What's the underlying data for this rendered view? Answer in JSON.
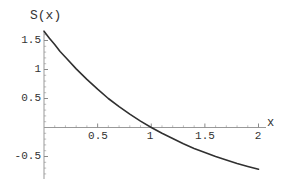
{
  "figure": {
    "background": "#ffffff",
    "y_axis_label": "S(x)",
    "x_axis_label": "x"
  },
  "colors": {
    "curve": "#303030",
    "axis": "#999999",
    "tick": "#8a8a8a",
    "text": "#333333"
  },
  "chart_data": {
    "type": "line",
    "title": "",
    "xlabel": "x",
    "ylabel": "S(x)",
    "xlim": [
      0,
      2.05
    ],
    "ylim": [
      -0.9,
      1.66
    ],
    "grid": false,
    "legend": "none",
    "x_ticks": [
      0.5,
      1,
      1.5,
      2
    ],
    "x_tick_labels": [
      "0.5",
      "1",
      "1.5",
      "2"
    ],
    "y_ticks": [
      1.5,
      1,
      0.5,
      -0.5
    ],
    "y_tick_labels": [
      "1.5",
      "1",
      "0.5",
      "-0.5"
    ],
    "minor_tick_step": 0.1,
    "series": [
      {
        "name": "S(x)",
        "x": [
          0,
          0.05,
          0.1,
          0.15,
          0.2,
          0.3,
          0.4,
          0.5,
          0.6,
          0.7,
          0.8,
          0.9,
          1.0,
          1.1,
          1.2,
          1.3,
          1.4,
          1.5,
          1.6,
          1.7,
          1.8,
          1.9,
          2.0
        ],
        "y": [
          1.66,
          1.54,
          1.43,
          1.31,
          1.21,
          1.01,
          0.83,
          0.66,
          0.5,
          0.36,
          0.23,
          0.11,
          0.0,
          -0.1,
          -0.19,
          -0.28,
          -0.36,
          -0.43,
          -0.5,
          -0.56,
          -0.62,
          -0.67,
          -0.72
        ]
      }
    ],
    "annotations": {
      "x_intercept": 1.0,
      "value_at_left_edge": 1.66,
      "value_at_x2": -0.72
    }
  }
}
